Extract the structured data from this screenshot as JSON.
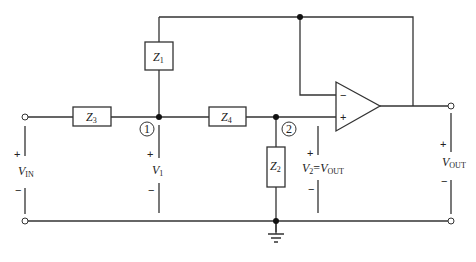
{
  "diagram": {
    "components": {
      "z1": {
        "name": "Z",
        "sub": "1"
      },
      "z2": {
        "name": "Z",
        "sub": "2"
      },
      "z3": {
        "name": "Z",
        "sub": "3"
      },
      "z4": {
        "name": "Z",
        "sub": "4"
      }
    },
    "nodes": {
      "node1": "1",
      "node2": "2"
    },
    "opamp": {
      "minus": "−",
      "plus": "+"
    },
    "voltages": {
      "vin": {
        "name": "V",
        "sub": "IN",
        "plus": "+",
        "minus": "−"
      },
      "v1": {
        "name": "V",
        "sub": "1",
        "plus": "+",
        "minus": "−"
      },
      "v2": {
        "name": "V",
        "sub": "2",
        "eq": "=",
        "name2": "V",
        "sub2": "OUT",
        "plus": "+",
        "minus": "−"
      },
      "vout": {
        "name": "V",
        "sub": "OUT",
        "plus": "+",
        "minus": "−"
      }
    },
    "colors": {
      "wire": "#333333",
      "background": "#ffffff"
    }
  }
}
